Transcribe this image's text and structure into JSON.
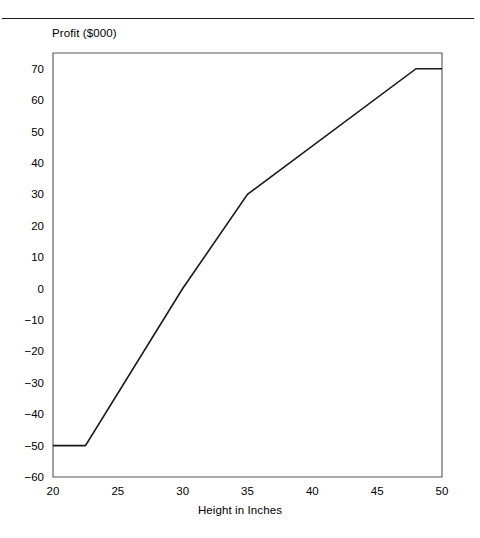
{
  "figure": {
    "top_rule": "horizontal-rule"
  },
  "chart_data": {
    "type": "line",
    "title": "",
    "xlabel": "Height in Inches",
    "ylabel": "Profit ($000)",
    "xlim": [
      20,
      50
    ],
    "ylim": [
      -60,
      75
    ],
    "xticks": [
      20,
      25,
      30,
      35,
      40,
      45,
      50
    ],
    "xtick_labels": [
      "20",
      "25",
      "30",
      "35",
      "40",
      "45",
      "50"
    ],
    "yticks": [
      -60,
      -50,
      -40,
      -30,
      -20,
      -10,
      0,
      10,
      20,
      30,
      40,
      50,
      60,
      70
    ],
    "ytick_labels": [
      "−60",
      "−50",
      "−40",
      "−30",
      "−20",
      "−10",
      "0",
      "10",
      "20",
      "30",
      "40",
      "50",
      "60",
      "70"
    ],
    "grid": false,
    "legend": null,
    "series": [
      {
        "name": "Profit",
        "color": "#1a1a1a",
        "line_width": 1.6,
        "x": [
          20,
          22.5,
          30,
          35,
          48,
          50
        ],
        "values": [
          -50,
          -50,
          0,
          30,
          70,
          70
        ]
      }
    ]
  },
  "colors": {
    "line": "#1a1a1a",
    "axis": "#555555",
    "background": "#ffffff",
    "rule": "#1a1a1a"
  }
}
